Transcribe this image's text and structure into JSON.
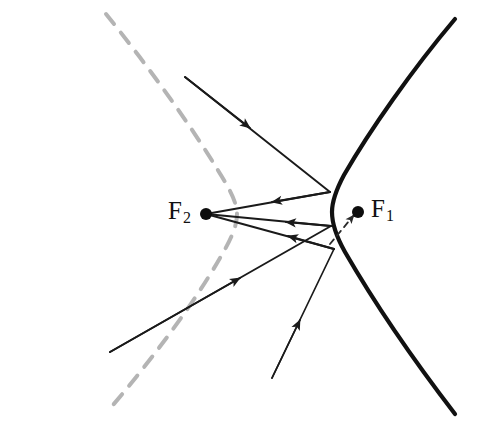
{
  "figure": {
    "kind": "hyperbola-reflection-diagram",
    "width": 477,
    "height": 428,
    "background": "#ffffff"
  },
  "labels": {
    "focus_right": {
      "base": "F",
      "sub": "1",
      "full": "F1",
      "x": 371,
      "y": 196
    },
    "focus_left": {
      "base": "F",
      "sub": "2",
      "full": "F2",
      "x": 168,
      "y": 198
    }
  },
  "colors": {
    "curve_solid": "#111111",
    "curve_dashed": "#b4b4b4",
    "ray": "#1a1a1a",
    "virtual_ray": "#3a3a3a",
    "dot": "#0d0d0d",
    "background": "#ffffff"
  },
  "points": {
    "focus_1": {
      "name": "F1",
      "x": 358,
      "y": 212,
      "r": 6
    },
    "focus_2": {
      "name": "F2",
      "x": 206,
      "y": 214,
      "r": 6
    },
    "vertex_right_branch": {
      "x": 332,
      "y": 212
    },
    "vertex_left_branch": {
      "x": 237,
      "y": 214
    },
    "reflection_upper": {
      "x": 330,
      "y": 192
    },
    "reflection_middle": {
      "x": 331,
      "y": 226
    },
    "reflection_lower": {
      "x": 334,
      "y": 249
    }
  },
  "curves": {
    "right_branch": {
      "style": "solid",
      "width": 4.2,
      "path": "M 455 19 C 412 70 370 130 344 175 C 336 190 332 201 332 212 C 332 224 336 236 345 252 C 371 297 412 358 455 414"
    },
    "left_branch": {
      "style": "dashed",
      "width": 4.0,
      "dash": "13 11",
      "path": "M 106 14 C 148 66 192 127 219 172 C 229 188 237 202 237 214 C 237 227 230 241 220 258 C 193 305 150 362 107 412"
    }
  },
  "rays": [
    {
      "id": "incoming-upper",
      "type": "incoming",
      "from": {
        "x": 185,
        "y": 77
      },
      "to": {
        "x": 330,
        "y": 192
      },
      "arrow_at": {
        "x": 250,
        "y": 128
      },
      "note": "ray aimed toward far focus F1, strikes branch at upper point"
    },
    {
      "id": "incoming-lower-left",
      "type": "incoming",
      "from": {
        "x": 110,
        "y": 352
      },
      "to": {
        "x": 331,
        "y": 226
      },
      "arrow_at": {
        "x": 240,
        "y": 278
      },
      "note": "ray aimed toward far focus F1, strikes branch at middle point"
    },
    {
      "id": "incoming-bottom",
      "type": "incoming",
      "from": {
        "x": 272,
        "y": 378
      },
      "to": {
        "x": 334,
        "y": 249
      },
      "arrow_at": {
        "x": 300,
        "y": 320
      },
      "note": "ray aimed toward far focus F1, strikes branch at lower point"
    },
    {
      "id": "reflected-upper",
      "type": "reflected",
      "from": {
        "x": 330,
        "y": 192
      },
      "to": {
        "x": 206,
        "y": 214
      },
      "arrow_at": {
        "x": 272,
        "y": 202
      },
      "note": "reflects to near focus F2"
    },
    {
      "id": "reflected-middle",
      "type": "reflected",
      "from": {
        "x": 334,
        "y": 249
      },
      "to": {
        "x": 206,
        "y": 214
      },
      "arrow_at": {
        "x": 288,
        "y": 236
      },
      "note": "reflects to near focus F2"
    },
    {
      "id": "reflected-lower",
      "type": "reflected",
      "from": {
        "x": 331,
        "y": 226
      },
      "to": {
        "x": 206,
        "y": 214
      },
      "arrow_at": {
        "x": 286,
        "y": 222
      },
      "note": "reflects to near focus F2"
    },
    {
      "id": "virtual-extension",
      "type": "virtual-dashed",
      "from": {
        "x": 330,
        "y": 244
      },
      "to": {
        "x": 354,
        "y": 215
      },
      "arrow_at": {
        "x": 348,
        "y": 220
      },
      "dash": "6 5",
      "note": "dashed continuation pointing at F1"
    }
  ],
  "annotations": {
    "caption": "",
    "description": "Rays directed toward the far focus F1 of a hyperbola reflect off the near branch and converge on the near focus F2."
  }
}
